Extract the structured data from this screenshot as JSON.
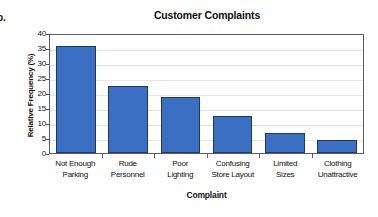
{
  "item_marker": "b.",
  "chart_data": {
    "type": "bar",
    "title": "Customer Complaints",
    "xlabel": "Complaint",
    "ylabel": "Relative Frequency (%)",
    "categories": [
      "Not Enough Parking",
      "Rude Personnel",
      "Poor Lighting",
      "Confusing Store Layout",
      "Limited Sizes",
      "Clothing Unattractive"
    ],
    "category_lines": [
      [
        "Not Enough",
        "Parking"
      ],
      [
        "Rude",
        "Personnel"
      ],
      [
        "Poor",
        "Lighting"
      ],
      [
        "Confusing",
        "Store Layout"
      ],
      [
        "Limited",
        "Sizes"
      ],
      [
        "Clothing",
        "Unattractive"
      ]
    ],
    "values": [
      35.7,
      22.2,
      18.8,
      12.4,
      6.6,
      4.3
    ],
    "ylim": [
      0,
      40
    ],
    "yticks": [
      40,
      35,
      30,
      25,
      20,
      15,
      10,
      5,
      0
    ],
    "grid": "horizontal",
    "legend": "none",
    "bar_color": "#3b6fc4",
    "bar_border_color": "#1f3864",
    "grid_color": "#e3e5e8",
    "axis_color": "#5a5d61"
  }
}
